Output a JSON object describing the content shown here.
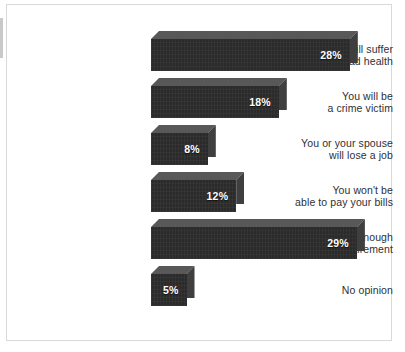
{
  "chart_data": {
    "type": "bar",
    "orientation": "horizontal",
    "title": "",
    "subtitle": "",
    "xlabel": "",
    "ylabel": "",
    "grid": false,
    "legend": null,
    "xlim": [
      0,
      31
    ],
    "value_suffix": "%",
    "categories": [
      "You will suffer\nfrom bad health",
      "You will be\na crime victim",
      "You or your spouse\nwill lose a job",
      "You won't be\nable to pay your bills",
      "You won't have enough\nmoney for retirement",
      "No opinion"
    ],
    "values": [
      28,
      18,
      8,
      12,
      29,
      5
    ],
    "value_labels": [
      "28%",
      "18%",
      "8%",
      "12%",
      "29%",
      "5%"
    ],
    "colors": {
      "bar_front": "#2b2b2b",
      "bar_top": "#585858",
      "bar_side": "#3f3f3f",
      "value_text": "#ffffff",
      "label_text": "#2f2f33",
      "background": "#ffffff",
      "frame_border": "#d9d9d9"
    }
  },
  "layout": {
    "label_column_right_px": 138,
    "bar_origin_x_px": 144,
    "px_per_unit": 7.1,
    "row_height_px": 47,
    "bar_height_px": 40,
    "first_row_top_px": 26,
    "depth_px": 8
  }
}
